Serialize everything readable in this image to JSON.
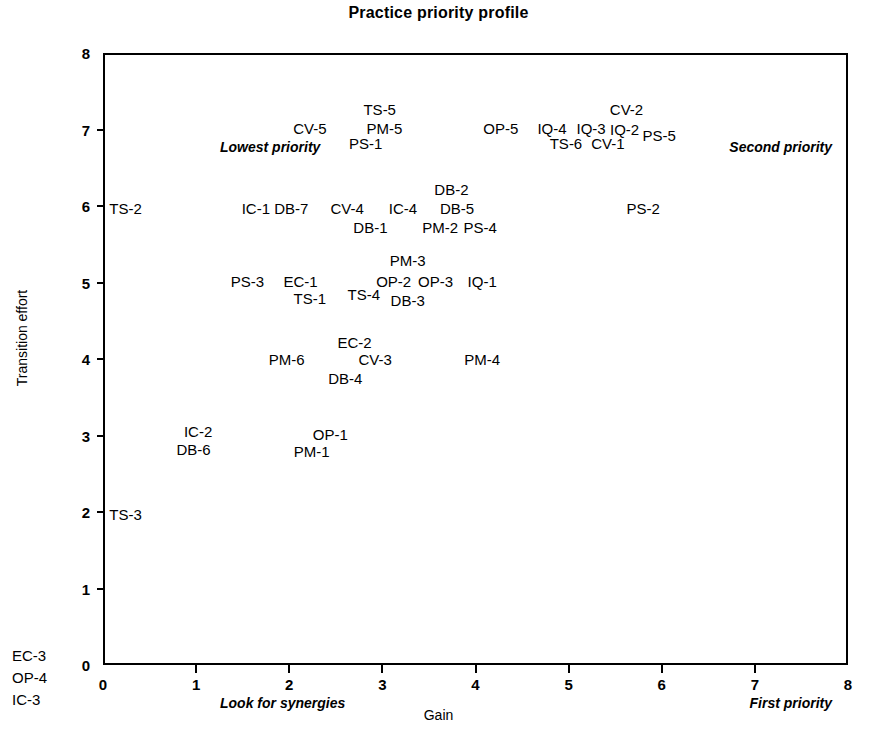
{
  "chart_data": {
    "type": "scatter",
    "title": "Practice priority profile",
    "xlabel": "Gain",
    "ylabel": "Transition effort",
    "xlim": [
      0,
      8
    ],
    "ylim": [
      0,
      8
    ],
    "xticks": [
      "0",
      "1",
      "2",
      "3",
      "4",
      "5",
      "6",
      "7",
      "8"
    ],
    "yticks": [
      "0",
      "1",
      "2",
      "3",
      "4",
      "5",
      "6",
      "7",
      "8"
    ],
    "grid": false,
    "legend": "none",
    "quadrant_notes": {
      "top_left": "Lowest priority",
      "top_right": "Second priority",
      "bottom_left": "Look for synergies",
      "bottom_right": "First priority"
    },
    "points": [
      {
        "label": "TS-5",
        "x": 2.95,
        "y": 7.3
      },
      {
        "label": "CV-2",
        "x": 5.6,
        "y": 7.3
      },
      {
        "label": "CV-5",
        "x": 2.2,
        "y": 7.05
      },
      {
        "label": "PM-5",
        "x": 3.0,
        "y": 7.05
      },
      {
        "label": "OP-5",
        "x": 4.25,
        "y": 7.05
      },
      {
        "label": "IQ-4",
        "x": 4.8,
        "y": 7.05
      },
      {
        "label": "IQ-3",
        "x": 5.22,
        "y": 7.05
      },
      {
        "label": "IQ-2",
        "x": 5.58,
        "y": 7.03
      },
      {
        "label": "PS-5",
        "x": 5.95,
        "y": 6.95
      },
      {
        "label": "PS-1",
        "x": 2.8,
        "y": 6.85
      },
      {
        "label": "TS-6",
        "x": 4.95,
        "y": 6.85
      },
      {
        "label": "CV-1",
        "x": 5.4,
        "y": 6.85
      },
      {
        "label": "DB-2",
        "x": 3.72,
        "y": 6.25
      },
      {
        "label": "TS-2",
        "x": 0.22,
        "y": 6.0
      },
      {
        "label": "IC-1",
        "x": 1.62,
        "y": 6.0
      },
      {
        "label": "DB-7",
        "x": 2.0,
        "y": 6.0
      },
      {
        "label": "CV-4",
        "x": 2.6,
        "y": 6.0
      },
      {
        "label": "IC-4",
        "x": 3.2,
        "y": 6.0
      },
      {
        "label": "DB-5",
        "x": 3.78,
        "y": 6.0
      },
      {
        "label": "PS-2",
        "x": 5.78,
        "y": 6.0
      },
      {
        "label": "DB-1",
        "x": 2.85,
        "y": 5.75
      },
      {
        "label": "PM-2",
        "x": 3.6,
        "y": 5.75
      },
      {
        "label": "PS-4",
        "x": 4.03,
        "y": 5.75
      },
      {
        "label": "PM-3",
        "x": 3.25,
        "y": 5.32
      },
      {
        "label": "PS-3",
        "x": 1.53,
        "y": 5.05
      },
      {
        "label": "EC-1",
        "x": 2.1,
        "y": 5.05
      },
      {
        "label": "OP-2",
        "x": 3.1,
        "y": 5.05
      },
      {
        "label": "OP-3",
        "x": 3.55,
        "y": 5.05
      },
      {
        "label": "IQ-1",
        "x": 4.05,
        "y": 5.05
      },
      {
        "label": "TS-1",
        "x": 2.2,
        "y": 4.82
      },
      {
        "label": "TS-4",
        "x": 2.78,
        "y": 4.88
      },
      {
        "label": "DB-3",
        "x": 3.25,
        "y": 4.8
      },
      {
        "label": "EC-2",
        "x": 2.68,
        "y": 4.25
      },
      {
        "label": "PM-6",
        "x": 1.95,
        "y": 4.03
      },
      {
        "label": "CV-3",
        "x": 2.9,
        "y": 4.03
      },
      {
        "label": "PM-4",
        "x": 4.05,
        "y": 4.03
      },
      {
        "label": "DB-4",
        "x": 2.58,
        "y": 3.78
      },
      {
        "label": "IC-2",
        "x": 1.0,
        "y": 3.08
      },
      {
        "label": "OP-1",
        "x": 2.42,
        "y": 3.05
      },
      {
        "label": "DB-6",
        "x": 0.95,
        "y": 2.85
      },
      {
        "label": "PM-1",
        "x": 2.22,
        "y": 2.83
      },
      {
        "label": "TS-3",
        "x": 0.22,
        "y": 2.0
      }
    ],
    "offscale_points": [
      {
        "label": "EC-3"
      },
      {
        "label": "OP-4"
      },
      {
        "label": "IC-3"
      }
    ]
  }
}
